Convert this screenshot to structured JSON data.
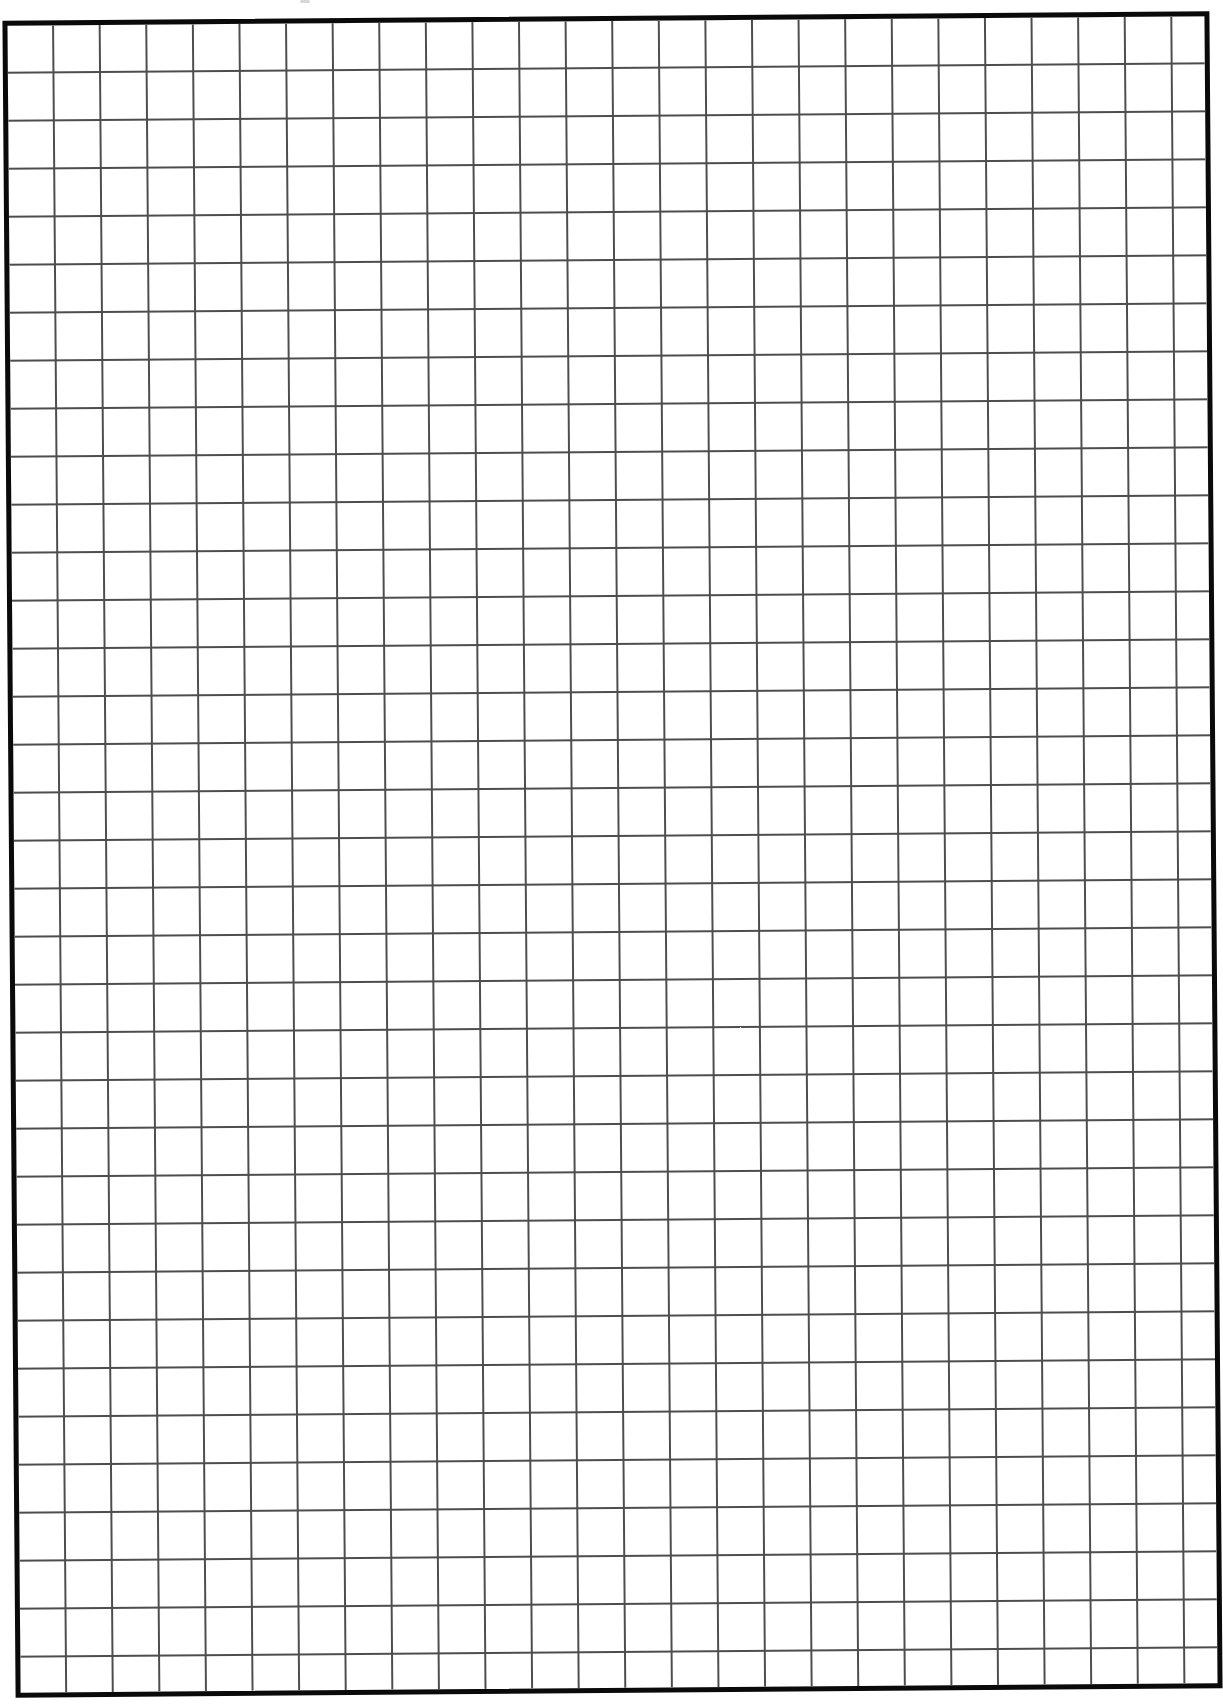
{
  "document": {
    "type": "graph-paper",
    "title": "",
    "background_color": "#ffffff",
    "border": {
      "color": "#0a0a0a",
      "width_px": 5
    },
    "grid": {
      "columns": 26,
      "rows": 35,
      "cell_width_px": 46.6,
      "cell_height_px": 48,
      "line_color": "#4d4d4d",
      "line_width_px": 2
    },
    "rotation_deg": -0.45
  }
}
